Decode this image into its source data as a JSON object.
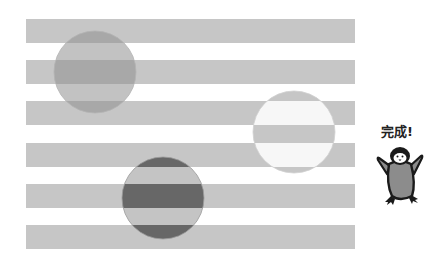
{
  "illusion": {
    "band_color": "#c6c6c6",
    "background_color": "#ffffff",
    "bands": [
      {
        "y": 19,
        "height": 24
      },
      {
        "y": 60,
        "height": 24
      },
      {
        "y": 101,
        "height": 24
      },
      {
        "y": 143,
        "height": 24
      },
      {
        "y": 184,
        "height": 24
      },
      {
        "y": 225,
        "height": 24
      }
    ],
    "band_x": 26,
    "band_width": 329,
    "circles": [
      {
        "name": "circle-medium",
        "cx": 95,
        "cy": 72,
        "r": 41,
        "stripe_color": "#a8a8a8",
        "gap_color": "#c2c2c2"
      },
      {
        "name": "circle-light",
        "cx": 294,
        "cy": 132,
        "r": 41,
        "stripe_color": "#f7f7f7",
        "gap_color": "#c6c6c6"
      },
      {
        "name": "circle-dark",
        "cx": 163,
        "cy": 198,
        "r": 41,
        "stripe_color": "#676767",
        "gap_color": "#c4c4c4"
      }
    ]
  },
  "caption": {
    "text": "完成!"
  },
  "mascot": {
    "icon": "penguin-icon",
    "body_color": "#8c8c8c",
    "outline_color": "#1a1a1a"
  }
}
